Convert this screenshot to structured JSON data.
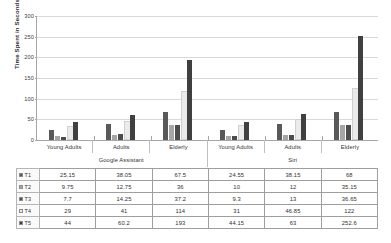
{
  "chart_data": {
    "type": "bar",
    "title": "",
    "xlabel": "",
    "ylabel": "Time Spent in Seconds",
    "ylim": [
      0,
      300
    ],
    "yticks": [
      "0",
      "50",
      "100",
      "150",
      "200",
      "250",
      "300"
    ],
    "grid": true,
    "legend_position": "table-left",
    "categories": [
      "Young Adults",
      "Adults",
      "Elderly",
      "Young Adults",
      "Adults",
      "Elderly"
    ],
    "group_labels": [
      "Google Assistant",
      "Siri"
    ],
    "series": [
      {
        "name": "T1",
        "color": "#595959",
        "values": [
          25.15,
          38.05,
          67.5,
          24.55,
          38.15,
          68
        ],
        "labels": [
          "25.15",
          "38.05",
          "67.5",
          "24.55",
          "38.15",
          "68"
        ]
      },
      {
        "name": "T2",
        "color": "#a6a6a6",
        "values": [
          9.75,
          12.75,
          36,
          10,
          12,
          35.15
        ],
        "labels": [
          "9.75",
          "12.75",
          "36",
          "10",
          "12",
          "35.15"
        ]
      },
      {
        "name": "T3",
        "color": "#4d4d4d",
        "values": [
          7.7,
          14.25,
          37.2,
          9.3,
          13,
          36.65
        ],
        "labels": [
          "7.7",
          "14.25",
          "37.2",
          "9.3",
          "13",
          "36.65"
        ]
      },
      {
        "name": "T4",
        "color": "#ebebeb",
        "values": [
          29,
          41,
          114,
          31,
          46.85,
          122
        ],
        "labels": [
          "29",
          "41",
          "114",
          "31",
          "46.85",
          "122"
        ]
      },
      {
        "name": "T5",
        "color": "#404040",
        "values": [
          44,
          60.2,
          193,
          44.15,
          63,
          252.6
        ],
        "labels": [
          "44",
          "60.2",
          "193",
          "44.15",
          "63",
          "252.6"
        ]
      }
    ]
  }
}
